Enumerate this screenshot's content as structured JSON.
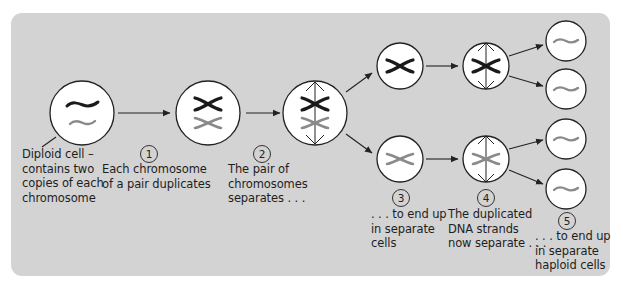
{
  "diagram": {
    "type": "meiosis-process",
    "colors": {
      "background": "#d3d3d3",
      "cell_fill": "#ffffff",
      "outline": "#222222",
      "chromosome_dark": "#1a1a1a",
      "chromosome_light": "#8a8a8a"
    },
    "cells": [
      {
        "id": "diploid",
        "chromosomes": [
          "dark-single",
          "light-single"
        ]
      },
      {
        "id": "duplicated",
        "chromosomes": [
          "dark-x",
          "light-x"
        ]
      },
      {
        "id": "separating",
        "chromosomes": [
          "dark-x",
          "light-x"
        ],
        "spindle": true
      },
      {
        "id": "cell-a",
        "chromosomes": [
          "dark-x"
        ]
      },
      {
        "id": "cell-b",
        "chromosomes": [
          "light-x"
        ]
      },
      {
        "id": "cell-a-separating",
        "chromosomes": [
          "dark-x"
        ],
        "spindle": true
      },
      {
        "id": "cell-b-separating",
        "chromosomes": [
          "light-x"
        ],
        "spindle": true
      },
      {
        "id": "haploid-1",
        "chromosomes": [
          "light-single"
        ]
      },
      {
        "id": "haploid-2",
        "chromosomes": [
          "light-single"
        ]
      },
      {
        "id": "haploid-3",
        "chromosomes": [
          "light-single"
        ]
      },
      {
        "id": "haploid-4",
        "chromosomes": [
          "light-single"
        ]
      }
    ]
  },
  "labels": {
    "diploid": [
      "Diploid cell –",
      "contains two",
      "copies of each",
      "chromosome"
    ],
    "step1": {
      "number": "1",
      "lines": [
        "Each chromosome",
        "of a pair duplicates"
      ]
    },
    "step2": {
      "number": "2",
      "lines": [
        "The pair of",
        "chromosomes",
        "separates . . ."
      ]
    },
    "step3": {
      "number": "3",
      "lines": [
        ". . . to end up",
        "in separate",
        "cells"
      ]
    },
    "step4": {
      "number": "4",
      "lines": [
        "The duplicated",
        "DNA strands",
        "now separate . . ."
      ]
    },
    "step5": {
      "number": "5",
      "lines": [
        ". . . to end up",
        "in separate",
        "haploid cells"
      ]
    }
  }
}
